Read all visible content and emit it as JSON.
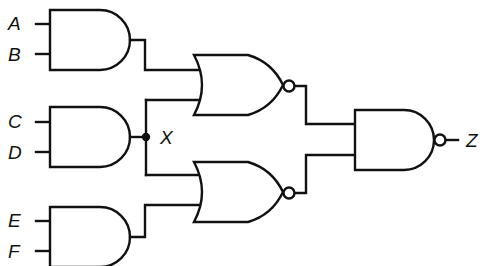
{
  "diagram": {
    "type": "logic-circuit",
    "inputs": {
      "a": "A",
      "b": "B",
      "c": "C",
      "d": "D",
      "e": "E",
      "f": "F"
    },
    "intermediate_node": "X",
    "output": "Z",
    "gates": [
      {
        "id": "and1",
        "type": "AND",
        "inputs": [
          "A",
          "B"
        ]
      },
      {
        "id": "and2",
        "type": "AND",
        "inputs": [
          "C",
          "D"
        ],
        "output_node": "X"
      },
      {
        "id": "and3",
        "type": "AND",
        "inputs": [
          "E",
          "F"
        ]
      },
      {
        "id": "nor1",
        "type": "NOR",
        "inputs": [
          "and1",
          "X"
        ]
      },
      {
        "id": "nor2",
        "type": "NOR",
        "inputs": [
          "X",
          "and3"
        ]
      },
      {
        "id": "nand1",
        "type": "NAND",
        "inputs": [
          "nor1",
          "nor2"
        ],
        "output": "Z"
      }
    ],
    "colors": {
      "line": "#111111",
      "background": "#ffffff"
    }
  }
}
